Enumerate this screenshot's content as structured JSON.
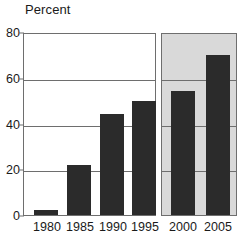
{
  "chart_data": {
    "type": "bar",
    "title": "",
    "subtitle": "",
    "xlabel": "",
    "ylabel": "Percent",
    "ylim": [
      0,
      80
    ],
    "yticks": [
      0,
      20,
      40,
      60,
      80
    ],
    "ytick_labels": [
      "0",
      "20",
      "40",
      "60",
      "80"
    ],
    "grid": true,
    "gridlines_at": [
      20,
      40,
      60,
      80
    ],
    "legend": "none",
    "categories": [
      "1980",
      "1985",
      "1990",
      "1995",
      "2000",
      "2005"
    ],
    "values": [
      2,
      22,
      44,
      50,
      54,
      70
    ],
    "series": [
      {
        "name": "Percent",
        "values": [
          2,
          22,
          44,
          50,
          54,
          70
        ]
      }
    ],
    "panels": [
      {
        "name": "historical",
        "background": "#ffffff",
        "categories": [
          "1980",
          "1985",
          "1990",
          "1995"
        ],
        "values": [
          2,
          22,
          44,
          50
        ]
      },
      {
        "name": "projected",
        "background": "#d9d9d9",
        "categories": [
          "2000",
          "2005"
        ],
        "values": [
          54,
          70
        ]
      }
    ],
    "colors": {
      "bar": "#2b2b2b",
      "axis": "#6e6e6e",
      "gridline": "#6e6e6e",
      "panel_historical_bg": "#ffffff",
      "panel_projected_bg": "#d9d9d9",
      "text": "#1a1a1a"
    }
  },
  "axis": {
    "y_title": "Percent",
    "ticks_y": [
      {
        "label": "80",
        "value": 80
      },
      {
        "label": "60",
        "value": 60
      },
      {
        "label": "40",
        "value": 40
      },
      {
        "label": "20",
        "value": 20
      },
      {
        "label": "0",
        "value": 0
      }
    ],
    "ticks_x": [
      {
        "label": "1980"
      },
      {
        "label": "1985"
      },
      {
        "label": "1990"
      },
      {
        "label": "1995"
      },
      {
        "label": "2000"
      },
      {
        "label": "2005"
      }
    ]
  }
}
